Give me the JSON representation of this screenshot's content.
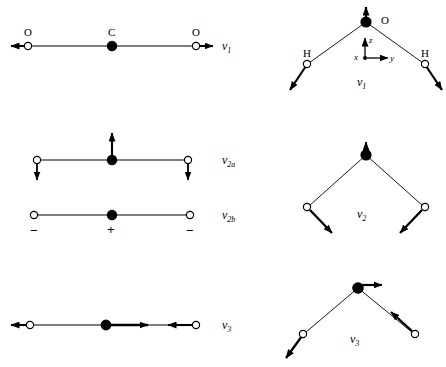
{
  "figure": {
    "background_color": "#ffffff",
    "stroke_color": "#000000",
    "open_atom_fill": "#ffffff",
    "closed_atom_fill": "#000000"
  },
  "co2": {
    "molecule": "CO2",
    "geometry": "linear",
    "atoms": {
      "left": "O",
      "center": "C",
      "right": "O"
    },
    "modes": [
      {
        "id": "co2-v1",
        "label": "ν",
        "subscript": "1",
        "name": "symmetric stretch",
        "displacements": "left O outward left, C stationary, right O outward right"
      },
      {
        "id": "co2-v2a",
        "label": "ν",
        "subscript": "2a",
        "name": "in-plane bend",
        "displacements": "C up, both O down"
      },
      {
        "id": "co2-v2b",
        "label": "ν",
        "subscript": "2b",
        "name": "out-of-plane bend",
        "signs": {
          "left": "−",
          "center": "+",
          "right": "−"
        }
      },
      {
        "id": "co2-v3",
        "label": "ν",
        "subscript": "3",
        "name": "asymmetric stretch",
        "displacements": "left O left, C right, right O left"
      }
    ]
  },
  "h2o": {
    "molecule": "H2O",
    "geometry": "bent",
    "atoms": {
      "apex": "O",
      "left": "H",
      "right": "H"
    },
    "axes": {
      "x": "x",
      "y": "y",
      "z": "z"
    },
    "modes": [
      {
        "id": "h2o-v1",
        "label": "ν",
        "subscript": "1",
        "name": "symmetric stretch",
        "displacements": "O up, both H outward along bonds",
        "show_axes": true
      },
      {
        "id": "h2o-v2",
        "label": "ν",
        "subscript": "2",
        "name": "bend",
        "displacements": "both H inward and downward",
        "show_axes": false
      },
      {
        "id": "h2o-v3",
        "label": "ν",
        "subscript": "3",
        "name": "asymmetric stretch",
        "displacements": "O right, left H down-left, right H up-left",
        "show_axes": false
      }
    ]
  }
}
